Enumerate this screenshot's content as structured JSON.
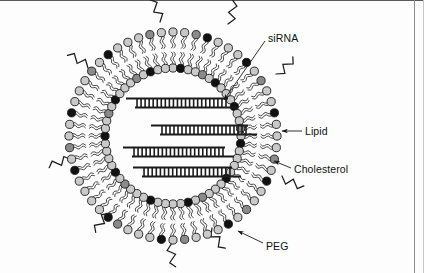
{
  "figure": {
    "background_color": "#fdfdfd",
    "frame_color": "#5a5a5a",
    "width": 424,
    "height": 273
  },
  "vesicle": {
    "center_x": 173,
    "center_y": 136,
    "outer_head_radius": 104,
    "inner_head_radius": 68,
    "lipid_count": 56,
    "head_radius_px": 4.1,
    "colors": {
      "lipid_head_light": "#c9c9c9",
      "lipid_head_mid": "#8a8a8a",
      "cholesterol_head_dark": "#111111",
      "tail_stroke": "#2a2a2a",
      "head_outline": "#1a1a1a"
    },
    "cholesterol_outer_indices": [
      3,
      7,
      12,
      18,
      23,
      29,
      34,
      39,
      44,
      50
    ],
    "cholesterol_inner_indices": [
      1,
      6,
      10,
      15,
      20,
      26,
      31,
      37,
      42,
      47,
      53
    ],
    "mid_gray_outer_indices": [
      2,
      9,
      16,
      21,
      27,
      33,
      41,
      48,
      54
    ],
    "mid_gray_inner_indices": [
      4,
      13,
      24,
      35,
      45,
      51
    ]
  },
  "peg_chains": [
    {
      "name": "peg-top-left",
      "x": 160,
      "y": 22,
      "rotation": -20,
      "scale": 1.0
    },
    {
      "name": "peg-top-right",
      "x": 228,
      "y": 24,
      "rotation": 15,
      "scale": 1.0
    },
    {
      "name": "peg-upper-left",
      "x": 88,
      "y": 68,
      "rotation": -55,
      "scale": 1.0
    },
    {
      "name": "peg-right",
      "x": 276,
      "y": 74,
      "rotation": 48,
      "scale": 1.0
    },
    {
      "name": "peg-left",
      "x": 72,
      "y": 160,
      "rotation": -105,
      "scale": 1.0
    },
    {
      "name": "peg-lower-right",
      "x": 282,
      "y": 176,
      "rotation": 118,
      "scale": 1.0
    },
    {
      "name": "peg-lower-left",
      "x": 110,
      "y": 213,
      "rotation": -140,
      "scale": 1.0
    },
    {
      "name": "peg-bottom",
      "x": 172,
      "y": 243,
      "rotation": 175,
      "scale": 1.0
    },
    {
      "name": "peg-bottom-right",
      "x": 212,
      "y": 228,
      "rotation": 150,
      "scale": 1.0
    }
  ],
  "sirna_duplexes": [
    {
      "name": "sirna-strand-1",
      "x1": 135,
      "x2": 228,
      "y": 103,
      "rungs": 23
    },
    {
      "name": "sirna-strand-2",
      "x1": 160,
      "x2": 248,
      "y": 130,
      "rungs": 22
    },
    {
      "name": "sirna-strand-3",
      "x1": 132,
      "x2": 225,
      "y": 152,
      "rungs": 23
    },
    {
      "name": "sirna-strand-4",
      "x1": 142,
      "x2": 232,
      "y": 172,
      "rungs": 22
    }
  ],
  "sirna_style": {
    "rail_color": "#1b1b1b",
    "rung_color": "#1b1b1b",
    "rail_thickness": 2.2,
    "rung_thickness": 1.6,
    "ladder_height": 9,
    "rail_overhang": 9
  },
  "labels": [
    {
      "name": "label-sirna",
      "text": "siRNA",
      "text_x": 268,
      "text_y": 32,
      "leader": {
        "x1": 265,
        "y1": 41,
        "x2": 224,
        "y2": 100
      },
      "arrow": "end"
    },
    {
      "name": "label-lipid",
      "text": "Lipid",
      "text_x": 305,
      "text_y": 125,
      "leader": {
        "x1": 302,
        "y1": 131,
        "x2": 282,
        "y2": 131
      },
      "arrow": "end"
    },
    {
      "name": "label-cholesterol",
      "text": "Cholesterol",
      "text_x": 294,
      "text_y": 163,
      "leader": {
        "x1": 291,
        "y1": 168,
        "x2": 274,
        "y2": 161
      },
      "arrow": "end"
    },
    {
      "name": "label-peg",
      "text": "PEG",
      "text_x": 266,
      "text_y": 240,
      "leader": {
        "x1": 263,
        "y1": 243,
        "x2": 238,
        "y2": 231
      },
      "arrow": "end"
    }
  ],
  "label_style": {
    "color": "#111111",
    "font_size_px": 10.5,
    "leader_color": "#1b1b1b",
    "leader_thickness": 0.9
  }
}
